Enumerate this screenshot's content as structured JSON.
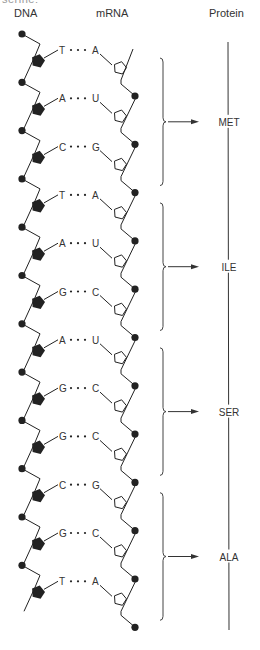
{
  "clipped_top_text": "serine:",
  "headers": {
    "dna": "DNA",
    "mrna": "mRNA",
    "protein": "Protein"
  },
  "base_pairs": [
    {
      "dna": "T",
      "mrna": "A"
    },
    {
      "dna": "A",
      "mrna": "U"
    },
    {
      "dna": "C",
      "mrna": "G"
    },
    {
      "dna": "T",
      "mrna": "A"
    },
    {
      "dna": "A",
      "mrna": "U"
    },
    {
      "dna": "G",
      "mrna": "C"
    },
    {
      "dna": "A",
      "mrna": "U"
    },
    {
      "dna": "G",
      "mrna": "C"
    },
    {
      "dna": "G",
      "mrna": "C"
    },
    {
      "dna": "C",
      "mrna": "G"
    },
    {
      "dna": "G",
      "mrna": "C"
    },
    {
      "dna": "T",
      "mrna": "A"
    }
  ],
  "codons": [
    {
      "amino_acid": "MET",
      "pairs": [
        0,
        1,
        2
      ]
    },
    {
      "amino_acid": "ILE",
      "pairs": [
        3,
        4,
        5
      ]
    },
    {
      "amino_acid": "SER",
      "pairs": [
        6,
        7,
        8
      ]
    },
    {
      "amino_acid": "ALA",
      "pairs": [
        9,
        10,
        11
      ]
    }
  ],
  "colors": {
    "ink": "#222222",
    "text": "#333333",
    "background": "#ffffff"
  },
  "icons": {
    "dna_sugar": "filled-pentagon",
    "rna_sugar": "outline-pentagon",
    "phosphate": "filled-circle",
    "codon_group": "curly-brace",
    "translate": "right-arrow"
  }
}
